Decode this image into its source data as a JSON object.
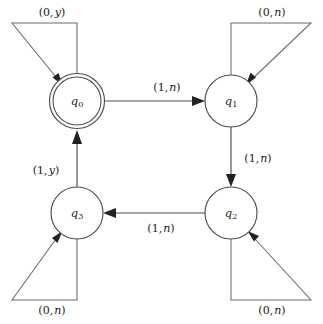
{
  "diagram": {
    "type": "state-transition-diagram",
    "background_color": "#ffffff",
    "line_color": "#4d4d4d",
    "text_color": "#1a1a1a"
  },
  "states": [
    {
      "id": "q0",
      "label": "q",
      "subscript": "0",
      "cx": 77,
      "cy": 101,
      "r": 27.5,
      "accepting": true,
      "inner_r": 24
    },
    {
      "id": "q1",
      "label": "q",
      "subscript": "1",
      "cx": 231,
      "cy": 101,
      "r": 26,
      "accepting": false,
      "inner_r": 0
    },
    {
      "id": "q2",
      "label": "q",
      "subscript": "2",
      "cx": 231,
      "cy": 213,
      "r": 26,
      "accepting": false,
      "inner_r": 0
    },
    {
      "id": "q3",
      "label": "q",
      "subscript": "3",
      "cx": 77,
      "cy": 213,
      "r": 26,
      "accepting": false,
      "inner_r": 0
    }
  ],
  "transitions": [
    {
      "id": "q0-to-q1",
      "from": "q0",
      "to": "q1",
      "first": "1",
      "second": "n",
      "label": "(1, n)",
      "label_x": 167,
      "label_y": 88
    },
    {
      "id": "q1-to-q2",
      "from": "q1",
      "to": "q2",
      "first": "1",
      "second": "n",
      "label": "(1, n)",
      "label_x": 258,
      "label_y": 159
    },
    {
      "id": "q2-to-q3",
      "from": "q2",
      "to": "q3",
      "first": "1",
      "second": "n",
      "label": "(1, n)",
      "label_x": 161,
      "label_y": 229
    },
    {
      "id": "q3-to-q0",
      "from": "q3",
      "to": "q0",
      "first": "1",
      "second": "y",
      "label": "(1, y)",
      "label_x": 46,
      "label_y": 171
    }
  ],
  "self_loops": [
    {
      "id": "loop-q0",
      "state": "q0",
      "first": "0",
      "second": "y",
      "label": "(0, y)",
      "label_x": 52,
      "label_y": 13,
      "corner": "top-left"
    },
    {
      "id": "loop-q1",
      "state": "q1",
      "first": "0",
      "second": "n",
      "label": "(0, n)",
      "label_x": 272,
      "label_y": 13,
      "corner": "top-right"
    },
    {
      "id": "loop-q2",
      "state": "q2",
      "first": "0",
      "second": "n",
      "label": "(0, n)",
      "label_x": 272,
      "label_y": 311,
      "corner": "bottom-right"
    },
    {
      "id": "loop-q3",
      "state": "q3",
      "first": "0",
      "second": "n",
      "label": "(0, n)",
      "label_x": 52,
      "label_y": 311,
      "corner": "bottom-left"
    }
  ]
}
